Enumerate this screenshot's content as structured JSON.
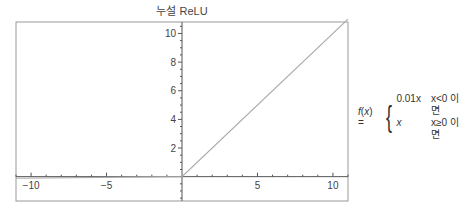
{
  "chart_data": {
    "type": "line",
    "title": "누설 ReLU",
    "xlabel": "",
    "ylabel": "",
    "xlim": [
      -11,
      11
    ],
    "ylim": [
      -1.7,
      10.8
    ],
    "x_ticks": [
      -10,
      -5,
      5,
      10
    ],
    "y_ticks": [
      2,
      4,
      6,
      8,
      10
    ],
    "grid": false,
    "series": [
      {
        "name": "Leaky ReLU",
        "color": "#aaaaaa",
        "x": [
          -11,
          0,
          11
        ],
        "y": [
          -0.11,
          0,
          11
        ]
      }
    ],
    "annotations": [
      {
        "text": "f(x) = { 0.01x  x<0 이면 ; x  x≥0 이면",
        "position": "right"
      }
    ]
  },
  "formula": {
    "lhs": "f(x) =",
    "case1_expr": "0.01x",
    "case1_cond": "x<0 이면",
    "case2_expr": "x",
    "case2_cond": "x≥0 이면"
  },
  "colors": {
    "line": "#aaaaaa",
    "axis": "#555555",
    "frame": "#888888"
  }
}
